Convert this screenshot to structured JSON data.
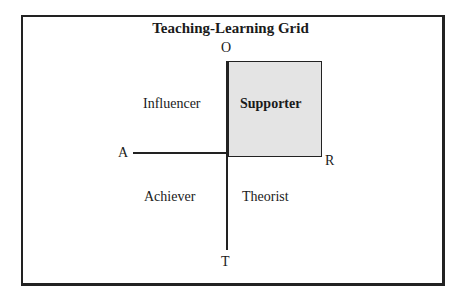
{
  "diagram": {
    "title": "Teaching-Learning Grid",
    "axes": {
      "top": "O",
      "bottom": "T",
      "left": "A",
      "right": "R"
    },
    "quadrants": {
      "top_left": "Influencer",
      "top_right": "Supporter",
      "bottom_left": "Achiever",
      "bottom_right": "Theorist"
    },
    "highlighted_quadrant": "top_right",
    "colors": {
      "line": "#222222",
      "highlight_fill": "#e0e0e0",
      "background": "#ffffff"
    }
  }
}
